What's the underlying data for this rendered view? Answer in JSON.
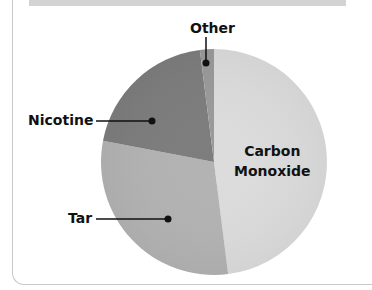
{
  "chart_data": {
    "type": "pie",
    "title": "",
    "categories": [
      "Carbon Monoxide",
      "Tar",
      "Nicotine",
      "Other"
    ],
    "values": [
      48,
      30,
      20,
      2
    ],
    "colors": [
      "#dcdcdc",
      "#b3b3b3",
      "#7d7d7d",
      "#9a9a9a"
    ],
    "start_angle": "12 o'clock, clockwise",
    "labels": {
      "other": "Other",
      "nicotine": "Nicotine",
      "tar": "Tar",
      "co_line1": "Carbon",
      "co_line2": "Monoxide"
    },
    "legend": "none (callout labels)"
  }
}
